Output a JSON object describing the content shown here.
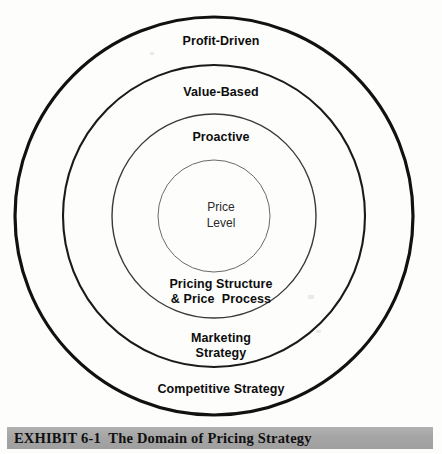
{
  "exhibit": {
    "caption": "EXHIBIT 6-1  The Domain of Pricing Strategy",
    "caption_bar_color": "#a8a8a8",
    "background_color": "#fdfdfc",
    "stroke_color": "#111111"
  },
  "diagram": {
    "type": "concentric-circles",
    "center": {
      "x": 214,
      "y": 216
    },
    "rings": [
      {
        "name": "competitive-strategy",
        "level": 1,
        "radius": 199,
        "stroke_width": 3.2,
        "label": "Competitive Strategy"
      },
      {
        "name": "marketing-strategy",
        "level": 2,
        "radius": 151,
        "stroke_width": 2.1,
        "label": "Marketing\nStrategy",
        "label_line_1": "Marketing",
        "label_line_2": "Strategy"
      },
      {
        "name": "pricing-structure-process",
        "level": 3,
        "radius": 102,
        "stroke_width": 1.4,
        "label": "Pricing Structure\n& Price  Process",
        "label_line_1": "Pricing Structure",
        "label_line_2": "& Price  Process"
      },
      {
        "name": "price-level",
        "level": 4,
        "radius": 56,
        "stroke_width": 1.0,
        "label": "Price\nLevel",
        "label_line_1": "Price",
        "label_line_2": "Level"
      }
    ],
    "top_labels": [
      {
        "name": "profit-driven",
        "text": "Profit-Driven",
        "ring": 1
      },
      {
        "name": "value-based",
        "text": "Value-Based",
        "ring": 2
      },
      {
        "name": "proactive",
        "text": "Proactive",
        "ring": 3
      }
    ],
    "core_label": "Price\nLevel",
    "bottom_labels": [
      {
        "name": "pricing-structure",
        "text": "Pricing Structure\n& Price  Process",
        "ring": 3
      },
      {
        "name": "marketing-strategy",
        "text": "Marketing\nStrategy",
        "ring": 2
      },
      {
        "name": "competitive-strategy",
        "text": "Competitive Strategy",
        "ring": 1
      }
    ]
  },
  "labels": {
    "profit_driven": "Profit-Driven",
    "value_based": "Value-Based",
    "proactive": "Proactive",
    "price_level": "Price\nLevel",
    "pricing_structure": "Pricing Structure",
    "price_process": "& Price  Process",
    "marketing": "Marketing",
    "strategy": "Strategy",
    "competitive_strategy": "Competitive Strategy"
  }
}
